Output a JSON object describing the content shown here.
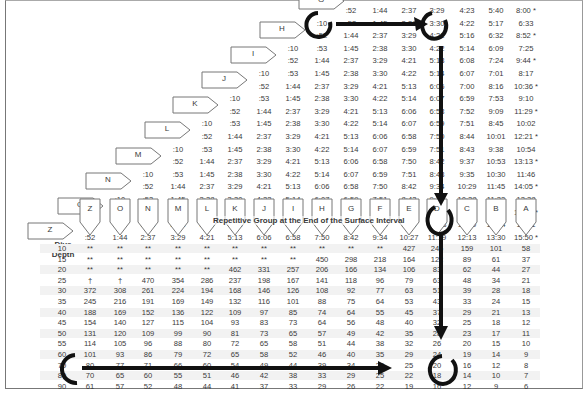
{
  "table": {
    "title": "Repetitive Group at the End of the Surface Interval",
    "depth_header_line1": "Dive",
    "depth_header_line2": "Depth",
    "group_columns": [
      "Z",
      "O",
      "N",
      "M",
      "L",
      "K",
      "J",
      "I",
      "H",
      "G",
      "F",
      "E",
      "D",
      "C",
      "B",
      "A"
    ],
    "surface_interval_rows": [
      {
        "group": "G",
        "min": [
          "",
          "",
          ":52",
          "1:44",
          "2:37",
          "3:29",
          "4:23",
          "5:40",
          "8:00 *"
        ]
      },
      {
        "group": "H",
        "min": [
          ":10",
          ":53",
          "1:45",
          "2:38",
          "3:30",
          "4:22",
          "5:17",
          "6:33"
        ],
        "max": [
          ":52",
          "1:44",
          "2:37",
          "3:29",
          "4:21",
          "5:16",
          "6:32",
          "8:52 *"
        ]
      },
      {
        "group": "I",
        "min": [
          ":10",
          ":53",
          "1:45",
          "2:38",
          "3:30",
          "4:22",
          "5:14",
          "6:09",
          "7:25"
        ],
        "max": [
          ":52",
          "1:44",
          "2:37",
          "3:29",
          "4:21",
          "5:13",
          "6:08",
          "7:24",
          "9:44 *"
        ]
      },
      {
        "group": "J",
        "min": [
          ":10",
          ":53",
          "1:45",
          "2:38",
          "3:30",
          "4:22",
          "5:14",
          "6:07",
          "7:01",
          "8:17"
        ],
        "max": [
          ":52",
          "1:44",
          "2:37",
          "3:29",
          "4:21",
          "5:13",
          "6:06",
          "7:00",
          "8:16",
          "10:36 *"
        ]
      },
      {
        "group": "K",
        "min": [
          ":10",
          ":53",
          "1:45",
          "2:38",
          "3:30",
          "4:22",
          "5:14",
          "6:07",
          "6:59",
          "7:53",
          "9:10"
        ],
        "max": [
          ":52",
          "1:44",
          "2:37",
          "3:29",
          "4:21",
          "5:13",
          "6:06",
          "6:58",
          "7:52",
          "9:09",
          "11:29 *"
        ]
      },
      {
        "group": "L",
        "min": [
          ":10",
          ":53",
          "1:45",
          "2:38",
          "3:30",
          "4:22",
          "5:14",
          "6:07",
          "6:59",
          "7:51",
          "8:45",
          "10:02"
        ],
        "max": [
          ":52",
          "1:44",
          "2:37",
          "3:29",
          "4:21",
          "5:13",
          "6:06",
          "6:58",
          "7:50",
          "8:44",
          "10:01",
          "12:21 *"
        ]
      },
      {
        "group": "M",
        "min": [
          ":10",
          ":53",
          "1:45",
          "2:38",
          "3:30",
          "4:22",
          "5:14",
          "6:07",
          "6:59",
          "7:51",
          "8:43",
          "9:38",
          "10:54"
        ],
        "max": [
          ":52",
          "1:44",
          "2:37",
          "3:29",
          "4:21",
          "5:13",
          "6:06",
          "6:58",
          "7:50",
          "8:42",
          "9:37",
          "10:53",
          "13:13 *"
        ]
      },
      {
        "group": "N",
        "min": [
          ":10",
          ":53",
          "1:45",
          "2:38",
          "3:30",
          "4:22",
          "5:14",
          "6:07",
          "6:59",
          "7:51",
          "8:43",
          "9:35",
          "10:30",
          "11:46"
        ],
        "max": [
          ":52",
          "1:44",
          "2:37",
          "3:29",
          "4:21",
          "5:13",
          "6:06",
          "6:58",
          "7:50",
          "8:42",
          "9:34",
          "10:29",
          "11:45",
          "14:05 *"
        ]
      },
      {
        "group": "O",
        "min": [
          ":10",
          ":53",
          "1:45",
          "2:38",
          "3:30",
          "4:22",
          "5:14",
          "6:07",
          "6:59",
          "7:51",
          "8:43",
          "9:35",
          "10:28",
          "11:22",
          "12:38"
        ],
        "max": [
          ":52",
          "1:44",
          "2:37",
          "3:29",
          "4:21",
          "5:13",
          "6:06",
          "6:58",
          "7:50",
          "8:42",
          "9:34",
          "10:27",
          "11:21",
          "12:37",
          "14:58 *"
        ]
      },
      {
        "group": "Z",
        "min": [
          ":10",
          ":53",
          "1:45",
          "2:38",
          "3:30",
          "4:22",
          "5:14",
          "6:07",
          "6:59",
          "7:51",
          "8:43",
          "9:35",
          "10:28",
          "11:20",
          "12:14",
          "13:31"
        ],
        "max": [
          ":52",
          "1:44",
          "2:37",
          "3:29",
          "4:21",
          "5:13",
          "6:06",
          "6:58",
          "7:50",
          "8:42",
          "9:34",
          "10:27",
          "11:19",
          "12:13",
          "13:30",
          "15:50 *"
        ]
      }
    ],
    "depth_rows": [
      {
        "depth": "10",
        "values": [
          "**",
          "**",
          "**",
          "**",
          "**",
          "**",
          "**",
          "**",
          "**",
          "**",
          "**",
          "427",
          "246",
          "159",
          "101",
          "58"
        ]
      },
      {
        "depth": "15",
        "values": [
          "**",
          "**",
          "**",
          "**",
          "**",
          "**",
          "**",
          "**",
          "450",
          "298",
          "218",
          "164",
          "122",
          "89",
          "61",
          "37"
        ]
      },
      {
        "depth": "20",
        "values": [
          "**",
          "**",
          "**",
          "**",
          "**",
          "462",
          "331",
          "257",
          "206",
          "166",
          "134",
          "106",
          "83",
          "62",
          "44",
          "27"
        ]
      },
      {
        "depth": "25",
        "values": [
          "†",
          "†",
          "470",
          "354",
          "286",
          "237",
          "198",
          "167",
          "141",
          "118",
          "96",
          "79",
          "63",
          "48",
          "34",
          "21"
        ]
      },
      {
        "depth": "30",
        "values": [
          "372",
          "308",
          "261",
          "224",
          "194",
          "168",
          "146",
          "126",
          "108",
          "92",
          "77",
          "63",
          "51",
          "39",
          "28",
          "18"
        ]
      },
      {
        "depth": "35",
        "values": [
          "245",
          "216",
          "191",
          "169",
          "149",
          "132",
          "116",
          "101",
          "88",
          "75",
          "64",
          "53",
          "43",
          "33",
          "24",
          "15"
        ]
      },
      {
        "depth": "40",
        "values": [
          "188",
          "169",
          "152",
          "136",
          "122",
          "109",
          "97",
          "85",
          "74",
          "64",
          "55",
          "45",
          "37",
          "29",
          "21",
          "13"
        ]
      },
      {
        "depth": "45",
        "values": [
          "154",
          "140",
          "127",
          "115",
          "104",
          "93",
          "83",
          "73",
          "64",
          "56",
          "48",
          "40",
          "32",
          "25",
          "18",
          "12"
        ]
      },
      {
        "depth": "50",
        "values": [
          "131",
          "120",
          "109",
          "99",
          "90",
          "81",
          "73",
          "65",
          "57",
          "49",
          "42",
          "35",
          "28",
          "23",
          "17",
          "11"
        ]
      },
      {
        "depth": "55",
        "values": [
          "114",
          "105",
          "96",
          "88",
          "80",
          "72",
          "65",
          "58",
          "51",
          "44",
          "38",
          "32",
          "26",
          "20",
          "15",
          "10"
        ]
      },
      {
        "depth": "60",
        "values": [
          "101",
          "93",
          "86",
          "79",
          "72",
          "65",
          "58",
          "52",
          "46",
          "40",
          "35",
          "29",
          "24",
          "19",
          "14",
          "9"
        ]
      },
      {
        "depth": "70",
        "values": [
          "80",
          "77",
          "71",
          "66",
          "60",
          "54",
          "49",
          "44",
          "39",
          "34",
          "29",
          "25",
          "20",
          "16",
          "12",
          "8"
        ]
      },
      {
        "depth": "80",
        "values": [
          "70",
          "65",
          "60",
          "55",
          "51",
          "46",
          "42",
          "38",
          "33",
          "29",
          "25",
          "22",
          "18",
          "14",
          "10",
          "7"
        ]
      },
      {
        "depth": "90",
        "values": [
          "61",
          "57",
          "52",
          "48",
          "44",
          "41",
          "37",
          "33",
          "29",
          "26",
          "22",
          "19",
          "16",
          "12",
          "9",
          "6"
        ]
      }
    ],
    "annotations": {
      "circled_start_group": "H",
      "circled_surface_interval": "3:30 – 4:21",
      "circled_new_group": "D",
      "circled_depth": "70",
      "circled_result": "20"
    }
  }
}
